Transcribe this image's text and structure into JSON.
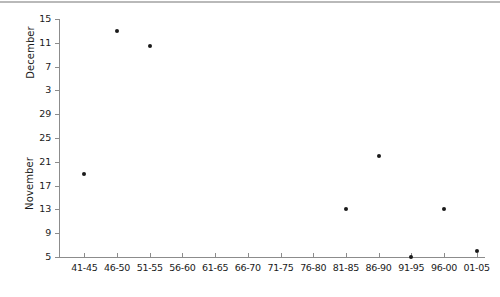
{
  "chart_data": {
    "type": "scatter",
    "title": "",
    "xlabel": "",
    "ylabel": "",
    "grid": false,
    "legend_position": "none",
    "categories": [
      "41-45",
      "46-50",
      "51-55",
      "56-60",
      "61-65",
      "66-70",
      "71-75",
      "76-80",
      "81-85",
      "86-90",
      "91-95",
      "96-00",
      "01-05"
    ],
    "panels": [
      {
        "name": "December",
        "axis_title": "December",
        "ylim": [
          3,
          15
        ],
        "yticks": [
          3,
          7,
          11,
          15
        ],
        "ytick_labels": [
          "3",
          "7",
          "11",
          "15"
        ],
        "points": [
          {
            "x": "46-50",
            "y": 13
          },
          {
            "x": "51-55",
            "y": 10.5
          }
        ]
      },
      {
        "name": "November",
        "axis_title": "November",
        "ylim": [
          5,
          29
        ],
        "yticks": [
          5,
          9,
          13,
          17,
          21,
          25,
          29
        ],
        "ytick_labels": [
          "5",
          "9",
          "13",
          "17",
          "21",
          "25",
          "29"
        ],
        "points": [
          {
            "x": "41-45",
            "y": 19
          },
          {
            "x": "81-85",
            "y": 13
          },
          {
            "x": "86-90",
            "y": 22
          },
          {
            "x": "91-95",
            "y": 5
          },
          {
            "x": "96-00",
            "y": 13
          },
          {
            "x": "01-05",
            "y": 6
          }
        ]
      }
    ],
    "y_axis_tick_labels_top_to_bottom": [
      "15",
      "11",
      "7",
      "3",
      "29",
      "25",
      "21",
      "17",
      "13",
      "9",
      "5"
    ],
    "marker_color": "#1a1a1a",
    "axis_color": "#8c8c8c"
  },
  "axis_titles": {
    "december": "December",
    "november": "November"
  }
}
